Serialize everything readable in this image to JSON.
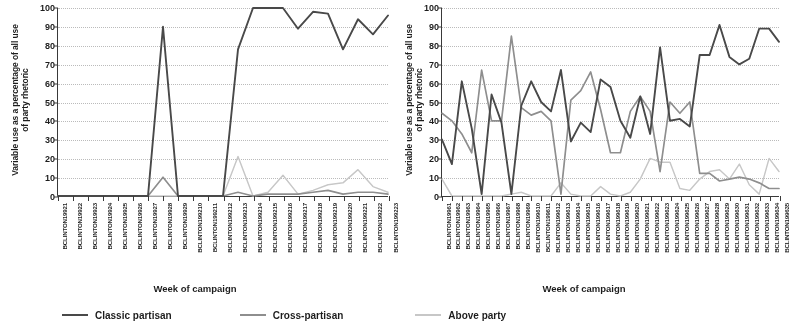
{
  "figure": {
    "y_axis_title_line1": "Variable use as a percentage of all use",
    "y_axis_title_line2": "of party rhetoric",
    "x_axis_title": "Week of campaign",
    "y_ticks": [
      "0",
      "10",
      "20",
      "30",
      "40",
      "50",
      "60",
      "70",
      "80",
      "90",
      "100"
    ]
  },
  "legend": {
    "items": [
      {
        "label": "Classic partisan",
        "color": "#4a4a4a",
        "style": "solid"
      },
      {
        "label": "Cross-partisan",
        "color": "#8e8e8e",
        "style": "solid"
      },
      {
        "label": "Above party",
        "color": "#c6c6c6",
        "style": "solid"
      }
    ]
  },
  "chart_data": [
    {
      "id": "panel-1992",
      "type": "line",
      "title": "",
      "xlabel": "Week of campaign",
      "ylabel": "Variable use as a percentage of all use of party rhetoric",
      "ylim": [
        0,
        100
      ],
      "ytick_step": 10,
      "grid": true,
      "legend_position": "bottom",
      "categories": [
        "BCLINTON19921",
        "BCLINTON19922",
        "BCLINTON19923",
        "BCLINTON19924",
        "BCLINTON19925",
        "BCLINTON19926",
        "BCLINTON19927",
        "BCLINTON19928",
        "BCLINTON19929",
        "BCLINTON199210",
        "BCLINTON199211",
        "BCLINTON199212",
        "BCLINTON199213",
        "BCLINTON199214",
        "BCLINTON199215",
        "BCLINTON199216",
        "BCLINTON199217",
        "BCLINTON199218",
        "BCLINTON199219",
        "BCLINTON199220",
        "BCLINTON199221",
        "BCLINTON199222",
        "BCLINTON199223"
      ],
      "series": [
        {
          "name": "Classic partisan",
          "color": "#4a4a4a",
          "values": [
            0,
            0,
            0,
            0,
            0,
            0,
            0,
            90,
            0,
            0,
            0,
            0,
            78,
            100,
            100,
            100,
            89,
            98,
            97,
            78,
            94,
            86,
            96
          ]
        },
        {
          "name": "Cross-partisan",
          "color": "#8e8e8e",
          "values": [
            0,
            0,
            0,
            0,
            0,
            0,
            0,
            10,
            0,
            0,
            0,
            0,
            2,
            0,
            1,
            1,
            1,
            2,
            3,
            1,
            2,
            2,
            1
          ]
        },
        {
          "name": "Above party",
          "color": "#c6c6c6",
          "values": [
            0,
            0,
            0,
            0,
            0,
            0,
            0,
            0,
            0,
            0,
            0,
            0,
            21,
            0,
            2,
            11,
            1,
            3,
            6,
            7,
            14,
            5,
            2
          ]
        }
      ]
    },
    {
      "id": "panel-1996",
      "type": "line",
      "title": "",
      "xlabel": "Week of campaign",
      "ylabel": "Variable use as a percentage of all use of party rhetoric",
      "ylim": [
        0,
        100
      ],
      "ytick_step": 10,
      "grid": true,
      "legend_position": "bottom",
      "categories": [
        "BCLINTON19961",
        "BCLINTON19962",
        "BCLINTON19963",
        "BCLINTON19964",
        "BCLINTON19965",
        "BCLINTON19966",
        "BCLINTON19967",
        "BCLINTON19968",
        "BCLINTON19969",
        "BCLINTON199610",
        "BCLINTON199611",
        "BCLINTON199612",
        "BCLINTON199613",
        "BCLINTON199614",
        "BCLINTON199615",
        "BCLINTON199616",
        "BCLINTON199617",
        "BCLINTON199618",
        "BCLINTON199619",
        "BCLINTON199620",
        "BCLINTON199621",
        "BCLINTON199622",
        "BCLINTON199623",
        "BCLINTON199624",
        "BCLINTON199625",
        "BCLINTON199626",
        "BCLINTON199627",
        "BCLINTON199628",
        "BCLINTON199629",
        "BCLINTON199630",
        "BCLINTON199631",
        "BCLINTON199632",
        "BCLINTON199633",
        "BCLINTON199634",
        "BCLINTON199635"
      ],
      "series": [
        {
          "name": "Classic partisan",
          "color": "#4a4a4a",
          "values": [
            30,
            17,
            61,
            36,
            1,
            54,
            39,
            1,
            48,
            61,
            50,
            45,
            67,
            29,
            39,
            34,
            62,
            58,
            40,
            31,
            53,
            33,
            79,
            40,
            41,
            37,
            75,
            75,
            91,
            74,
            70,
            73,
            89,
            89,
            82
          ]
        },
        {
          "name": "Cross-partisan",
          "color": "#8e8e8e",
          "values": [
            44,
            40,
            33,
            23,
            67,
            40,
            40,
            85,
            47,
            43,
            45,
            40,
            1,
            51,
            56,
            66,
            46,
            23,
            23,
            45,
            53,
            45,
            13,
            50,
            44,
            50,
            12,
            12,
            8,
            9,
            10,
            9,
            7,
            4,
            4
          ]
        },
        {
          "name": "Above party",
          "color": "#c6c6c6",
          "values": [
            9,
            0,
            0,
            0,
            0,
            0,
            0,
            1,
            2,
            0,
            0,
            0,
            7,
            1,
            0,
            0,
            5,
            1,
            0,
            2,
            9,
            20,
            18,
            18,
            4,
            3,
            9,
            13,
            14,
            9,
            17,
            6,
            1,
            20,
            13
          ]
        }
      ]
    }
  ]
}
